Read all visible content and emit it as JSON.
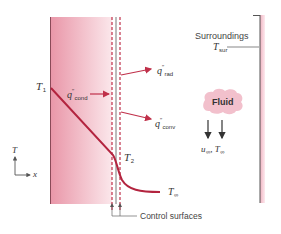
{
  "diagram": {
    "colors": {
      "wall_fill_dark": "#e89aab",
      "wall_fill_light": "#fbe6ea",
      "wall_edge": "#7a3a48",
      "profile_curve": "#b3243f",
      "arrow_red": "#c0304a",
      "control_dashed": "#c0304a",
      "surroundings_shade": "#f4c7d1",
      "fluid_cloud": "#f2c2cd",
      "text": "#333333",
      "line_dark": "#555555"
    },
    "labels": {
      "T1": {
        "main": "T",
        "sub": "1"
      },
      "T2": {
        "main": "T",
        "sub": "2"
      },
      "T_inf": {
        "main": "T",
        "sub": "∞"
      },
      "q_cond": {
        "main": "q",
        "sup": "″",
        "sub": "cond"
      },
      "q_rad": {
        "main": "q",
        "sup": "″",
        "sub": "rad"
      },
      "q_conv": {
        "main": "q",
        "sup": "″",
        "sub": "conv"
      },
      "surroundings": "Surroundings",
      "T_sur": {
        "main": "T",
        "sub": "sur"
      },
      "fluid": "Fluid",
      "u_inf": {
        "main": "u",
        "sub": "∞"
      },
      "T_inf_fluid": {
        "main": "T",
        "sub": "∞"
      },
      "control_surfaces": "Control surfaces",
      "axis_T": "T",
      "axis_x": "x"
    }
  }
}
